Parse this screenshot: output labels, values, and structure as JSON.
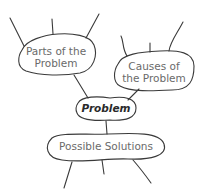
{
  "diagram": {
    "nodes": {
      "parts": {
        "line1": "Parts of the",
        "line2": "Problem"
      },
      "causes": {
        "line1": "Causes of",
        "line2": "the Problem"
      },
      "problem": {
        "label": "Problem"
      },
      "solutions": {
        "label": "Possible Solutions"
      }
    },
    "colors": {
      "stroke": "#3a3a3a",
      "text": "#6a6a6a",
      "center_text": "#2a2a2a"
    }
  }
}
